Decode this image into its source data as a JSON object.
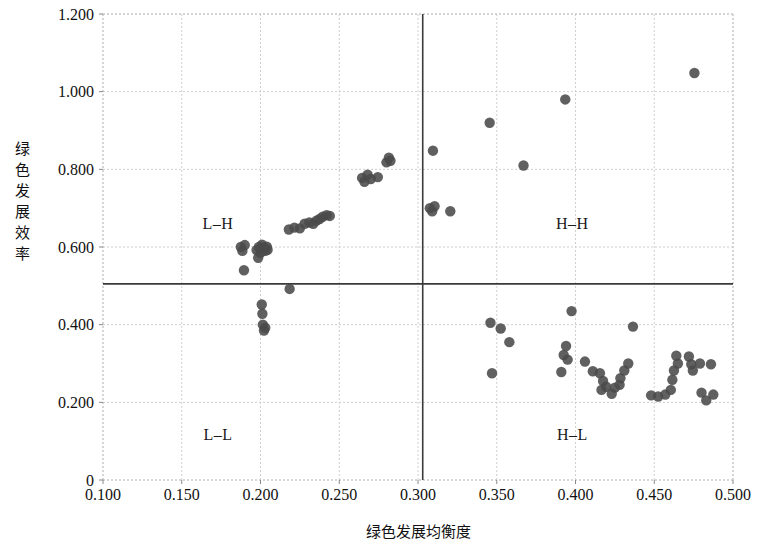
{
  "chart_data": {
    "type": "scatter",
    "title": "",
    "xlabel": "绿色发展均衡度",
    "ylabel": "绿色发展效率",
    "xlim": [
      0.1,
      0.5
    ],
    "ylim": [
      0.0,
      1.2
    ],
    "xticks": [
      "0.100",
      "0.150",
      "0.200",
      "0.250",
      "0.300",
      "0.350",
      "0.400",
      "0.450",
      "0.500"
    ],
    "xtick_values": [
      0.1,
      0.15,
      0.2,
      0.25,
      0.3,
      0.35,
      0.4,
      0.45,
      0.5
    ],
    "yticks": [
      "0",
      "0.200",
      "0.400",
      "0.600",
      "0.800",
      "1.000",
      "1.200"
    ],
    "ytick_values": [
      0.0,
      0.2,
      0.4,
      0.6,
      0.8,
      1.0,
      1.2
    ],
    "grid": true,
    "grid_style": "dashed",
    "legend": "none",
    "point_color": "#4a4a4a",
    "point_radius": 5.2,
    "reference_lines": {
      "vertical_x": 0.303,
      "horizontal_y": 0.505,
      "color": "#3a3a3a",
      "width": 1.6
    },
    "quadrant_labels": [
      {
        "text": "L–H",
        "x": 0.173,
        "y": 0.66
      },
      {
        "text": "H–H",
        "x": 0.398,
        "y": 0.66
      },
      {
        "text": "L–L",
        "x": 0.173,
        "y": 0.115
      },
      {
        "text": "H–L",
        "x": 0.398,
        "y": 0.115
      }
    ],
    "points": [
      {
        "x": 0.1875,
        "y": 0.6
      },
      {
        "x": 0.1885,
        "y": 0.59
      },
      {
        "x": 0.19,
        "y": 0.605
      },
      {
        "x": 0.1895,
        "y": 0.54
      },
      {
        "x": 0.1975,
        "y": 0.592
      },
      {
        "x": 0.1985,
        "y": 0.572
      },
      {
        "x": 0.199,
        "y": 0.6
      },
      {
        "x": 0.2,
        "y": 0.585
      },
      {
        "x": 0.201,
        "y": 0.606
      },
      {
        "x": 0.202,
        "y": 0.598
      },
      {
        "x": 0.203,
        "y": 0.59
      },
      {
        "x": 0.204,
        "y": 0.601
      },
      {
        "x": 0.2045,
        "y": 0.593
      },
      {
        "x": 0.2008,
        "y": 0.452
      },
      {
        "x": 0.2012,
        "y": 0.428
      },
      {
        "x": 0.2015,
        "y": 0.4
      },
      {
        "x": 0.2022,
        "y": 0.385
      },
      {
        "x": 0.203,
        "y": 0.392
      },
      {
        "x": 0.2185,
        "y": 0.492
      },
      {
        "x": 0.218,
        "y": 0.645
      },
      {
        "x": 0.2215,
        "y": 0.65
      },
      {
        "x": 0.225,
        "y": 0.648
      },
      {
        "x": 0.228,
        "y": 0.66
      },
      {
        "x": 0.231,
        "y": 0.663
      },
      {
        "x": 0.2335,
        "y": 0.66
      },
      {
        "x": 0.2355,
        "y": 0.668
      },
      {
        "x": 0.2375,
        "y": 0.672
      },
      {
        "x": 0.2395,
        "y": 0.678
      },
      {
        "x": 0.242,
        "y": 0.682
      },
      {
        "x": 0.244,
        "y": 0.68
      },
      {
        "x": 0.2645,
        "y": 0.778
      },
      {
        "x": 0.266,
        "y": 0.768
      },
      {
        "x": 0.268,
        "y": 0.786
      },
      {
        "x": 0.27,
        "y": 0.775
      },
      {
        "x": 0.2745,
        "y": 0.78
      },
      {
        "x": 0.28,
        "y": 0.818
      },
      {
        "x": 0.2815,
        "y": 0.83
      },
      {
        "x": 0.2825,
        "y": 0.822
      },
      {
        "x": 0.3075,
        "y": 0.7
      },
      {
        "x": 0.309,
        "y": 0.692
      },
      {
        "x": 0.3105,
        "y": 0.705
      },
      {
        "x": 0.3205,
        "y": 0.692
      },
      {
        "x": 0.3095,
        "y": 0.848
      },
      {
        "x": 0.3455,
        "y": 0.92
      },
      {
        "x": 0.367,
        "y": 0.81
      },
      {
        "x": 0.3935,
        "y": 0.98
      },
      {
        "x": 0.4755,
        "y": 1.048
      },
      {
        "x": 0.346,
        "y": 0.405
      },
      {
        "x": 0.3525,
        "y": 0.39
      },
      {
        "x": 0.358,
        "y": 0.355
      },
      {
        "x": 0.347,
        "y": 0.275
      },
      {
        "x": 0.3925,
        "y": 0.322
      },
      {
        "x": 0.394,
        "y": 0.345
      },
      {
        "x": 0.395,
        "y": 0.31
      },
      {
        "x": 0.391,
        "y": 0.278
      },
      {
        "x": 0.3975,
        "y": 0.435
      },
      {
        "x": 0.406,
        "y": 0.305
      },
      {
        "x": 0.411,
        "y": 0.28
      },
      {
        "x": 0.4155,
        "y": 0.275
      },
      {
        "x": 0.4175,
        "y": 0.255
      },
      {
        "x": 0.4165,
        "y": 0.232
      },
      {
        "x": 0.4195,
        "y": 0.24
      },
      {
        "x": 0.423,
        "y": 0.222
      },
      {
        "x": 0.425,
        "y": 0.238
      },
      {
        "x": 0.428,
        "y": 0.245
      },
      {
        "x": 0.4285,
        "y": 0.262
      },
      {
        "x": 0.431,
        "y": 0.282
      },
      {
        "x": 0.4335,
        "y": 0.3
      },
      {
        "x": 0.4365,
        "y": 0.395
      },
      {
        "x": 0.448,
        "y": 0.218
      },
      {
        "x": 0.4525,
        "y": 0.215
      },
      {
        "x": 0.457,
        "y": 0.22
      },
      {
        "x": 0.4605,
        "y": 0.232
      },
      {
        "x": 0.4615,
        "y": 0.258
      },
      {
        "x": 0.4625,
        "y": 0.282
      },
      {
        "x": 0.465,
        "y": 0.3
      },
      {
        "x": 0.464,
        "y": 0.32
      },
      {
        "x": 0.472,
        "y": 0.318
      },
      {
        "x": 0.4735,
        "y": 0.298
      },
      {
        "x": 0.4745,
        "y": 0.282
      },
      {
        "x": 0.479,
        "y": 0.3
      },
      {
        "x": 0.48,
        "y": 0.225
      },
      {
        "x": 0.483,
        "y": 0.205
      },
      {
        "x": 0.4875,
        "y": 0.22
      },
      {
        "x": 0.486,
        "y": 0.298
      }
    ]
  }
}
